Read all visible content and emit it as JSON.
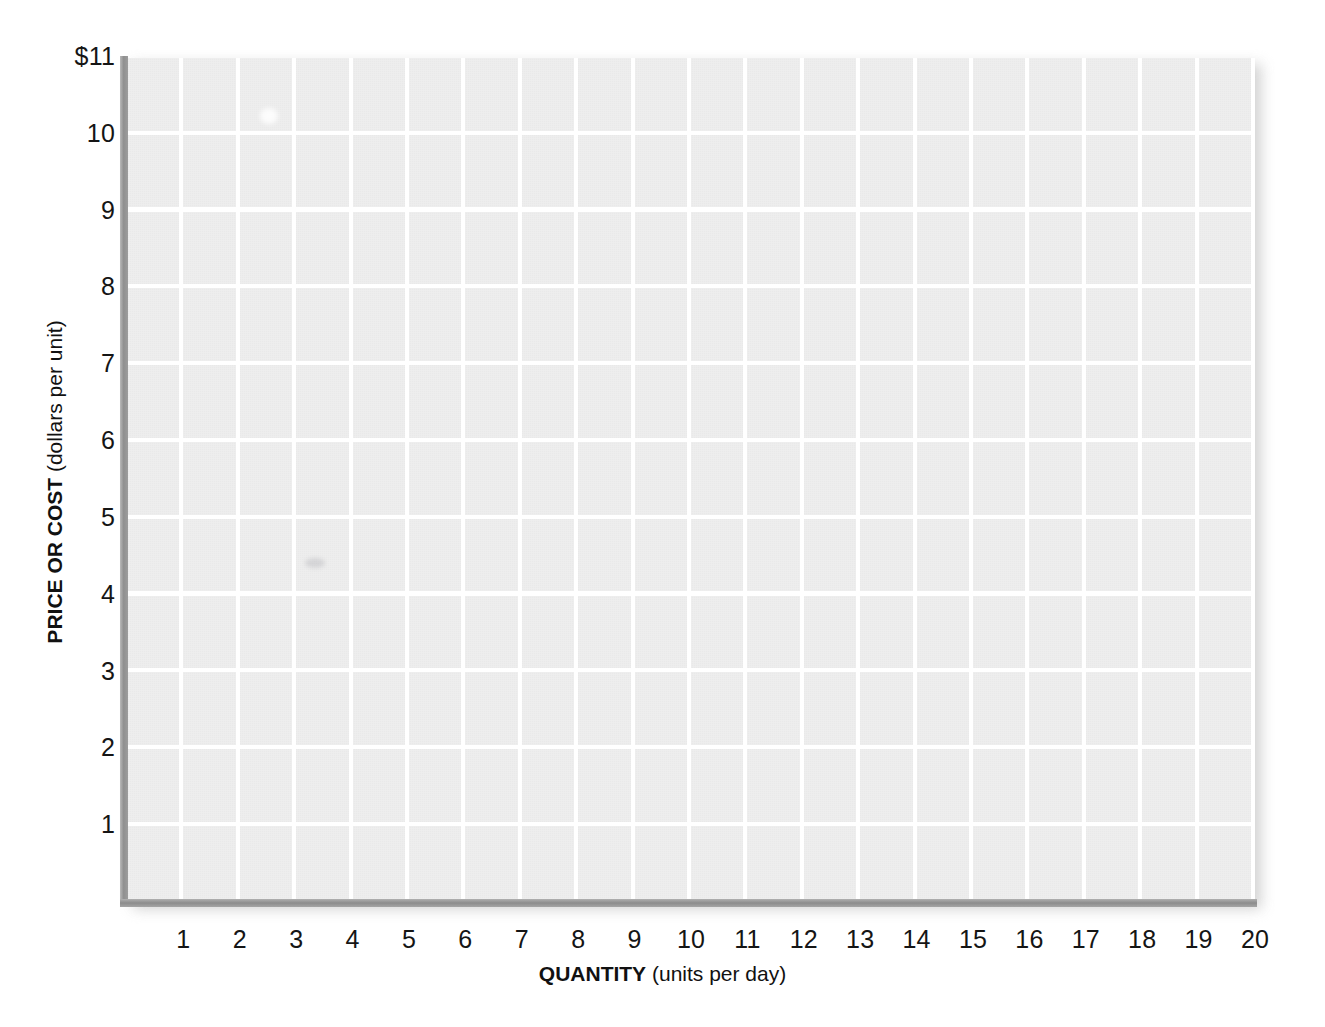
{
  "chart_data": {
    "type": "line",
    "title": "",
    "subtitle": "",
    "xlabel_bold": "QUANTITY",
    "xlabel_rest": " (units per day)",
    "ylabel_bold": "PRICE OR COST",
    "ylabel_rest": " (dollars per unit)",
    "xlabel": "QUANTITY (units per day)",
    "ylabel": "PRICE OR COST (dollars per unit)",
    "x_tick_labels": [
      "1",
      "2",
      "3",
      "4",
      "5",
      "6",
      "7",
      "8",
      "9",
      "10",
      "11",
      "12",
      "13",
      "14",
      "15",
      "16",
      "17",
      "18",
      "19",
      "20"
    ],
    "x_tick_values": [
      1,
      2,
      3,
      4,
      5,
      6,
      7,
      8,
      9,
      10,
      11,
      12,
      13,
      14,
      15,
      16,
      17,
      18,
      19,
      20
    ],
    "y_tick_labels": [
      "$11",
      "10",
      "9",
      "8",
      "7",
      "6",
      "5",
      "4",
      "3",
      "2",
      "1"
    ],
    "y_tick_values": [
      11,
      10,
      9,
      8,
      7,
      6,
      5,
      4,
      3,
      2,
      1
    ],
    "xlim": [
      0,
      20
    ],
    "ylim": [
      0,
      11
    ],
    "grid": true,
    "grid_color": "#ffffff",
    "plot_background": "#e9e9e9",
    "axis_color": "#8f8f8f",
    "text_color": "#151515",
    "legend": [],
    "series": [],
    "annotations": []
  },
  "figure": {
    "page_background": "#ffffff"
  }
}
